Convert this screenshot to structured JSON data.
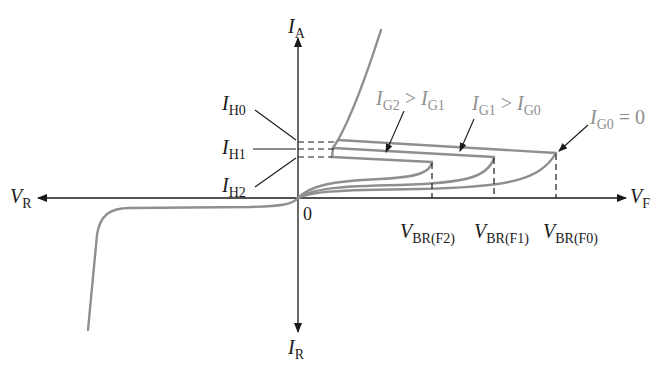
{
  "diagram": {
    "type": "SCR I-V characteristic",
    "axes": {
      "y_positive": {
        "main": "I",
        "sub": "A"
      },
      "y_negative": {
        "main": "I",
        "sub": "R"
      },
      "x_positive": {
        "main": "V",
        "sub": "F"
      },
      "x_negative": {
        "main": "V",
        "sub": "R"
      },
      "origin": "0"
    },
    "holding_currents": [
      {
        "main": "I",
        "sub": "H0"
      },
      {
        "main": "I",
        "sub": "H1"
      },
      {
        "main": "I",
        "sub": "H2"
      }
    ],
    "breakover_voltages": [
      {
        "main": "V",
        "sub": "BR(F2)"
      },
      {
        "main": "V",
        "sub": "BR(F1)"
      },
      {
        "main": "V",
        "sub": "BR(F0)"
      }
    ],
    "gate_annotations": [
      {
        "a_main": "I",
        "a_sub": "G2",
        "op": " > ",
        "b_main": "I",
        "b_sub": "G1"
      },
      {
        "a_main": "I",
        "a_sub": "G1",
        "op": " > ",
        "b_main": "I",
        "b_sub": "G0"
      },
      {
        "a_main": "I",
        "a_sub": "G0",
        "op": " = ",
        "b_main": "0",
        "b_sub": ""
      }
    ],
    "colors": {
      "axis": "#1a1a1a",
      "curve": "#8f8f8f",
      "background": "#ffffff"
    }
  }
}
